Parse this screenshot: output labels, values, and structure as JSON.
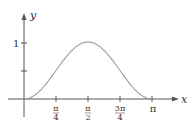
{
  "chart_data": {
    "type": "line",
    "title": "",
    "function": "y = sin^2(x)",
    "xlabel": "x",
    "ylabel": "y",
    "xlim": [
      0,
      3.14159
    ],
    "ylim": [
      0,
      1
    ],
    "grid": false,
    "legend": null,
    "x_ticks": [
      {
        "value": 0.7854,
        "label_num": "π",
        "label_den": "4"
      },
      {
        "value": 1.5708,
        "label_num": "π",
        "label_den": "2"
      },
      {
        "value": 2.3562,
        "label_num": "3π",
        "label_den": "4"
      },
      {
        "value": 3.14159,
        "label": "π"
      }
    ],
    "y_ticks": [
      {
        "value": 0.5,
        "label": ""
      },
      {
        "value": 1,
        "label": "1"
      }
    ],
    "series": [
      {
        "name": "sin²x",
        "color": "#9a9a9a",
        "x": [
          0,
          0.3927,
          0.7854,
          1.1781,
          1.5708,
          1.9635,
          2.3562,
          2.7489,
          3.14159
        ],
        "y": [
          0,
          0.1464,
          0.5,
          0.8536,
          1,
          0.8536,
          0.5,
          0.1464,
          0
        ]
      }
    ]
  },
  "labels": {
    "x_axis": "x",
    "y_axis": "y",
    "y_one": "1",
    "x_pi4_num": "π",
    "x_pi4_den": "4",
    "x_pi2_num": "π",
    "x_pi2_den": "2",
    "x_3pi4_num": "3π",
    "x_3pi4_den": "4",
    "x_pi": "π"
  },
  "colors": {
    "axis": "#555555",
    "curve": "#9a9a9a",
    "text": "#333333"
  }
}
